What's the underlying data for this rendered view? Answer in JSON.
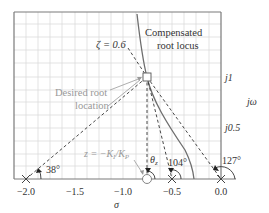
{
  "labels": {
    "compensated_line1": "Compensated",
    "compensated_line2": "root locus",
    "zeta": "ζ = 0.6",
    "desired_line1": "Desired root",
    "desired_line2": "location",
    "zero": "z = −K",
    "zero_sub_i": "I",
    "zero_slash": "/K",
    "zero_sub_p": "P",
    "theta": "θ",
    "theta_sub": "z",
    "angle_104": "104°",
    "angle_127": "127°",
    "angle_38": "38°",
    "j1": "j1",
    "j05": "j0.5",
    "jomega": "jω",
    "sigma": "σ"
  },
  "axes": {
    "x_ticks": [
      "−2.0",
      "−1.5",
      "−1.0",
      "−0.5",
      "0.0"
    ],
    "y_ticks": [
      "j0.5",
      "j1"
    ],
    "x_range": [
      -2.1,
      0.0
    ],
    "y_range": [
      0.0,
      1.65
    ]
  },
  "poles": [
    -2.0,
    -0.5,
    0.0
  ],
  "zero": -0.76,
  "desired_root": {
    "sigma": -0.76,
    "omega": 1.0
  },
  "angles": {
    "from_pole_-2": "38°",
    "from_pole_-0.5": "104°",
    "from_pole_0": "127°",
    "from_zero": "θz"
  },
  "colors": {
    "grid": "#d9d9d9",
    "border": "#7a7a7a",
    "locus": "#7a7a7a",
    "dash": "#333333",
    "label_gray": "#9a9a9a",
    "text": "#333333"
  }
}
